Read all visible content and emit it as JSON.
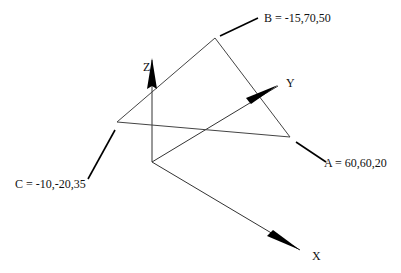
{
  "diagram": {
    "title": "",
    "axes": {
      "x": {
        "label": "X"
      },
      "y": {
        "label": "Y"
      },
      "z": {
        "label": "Z"
      }
    },
    "points": {
      "A": {
        "label": "A = 60,60,20",
        "coords": [
          60,
          60,
          20
        ]
      },
      "B": {
        "label": "B = -15,70,50",
        "coords": [
          -15,
          70,
          50
        ]
      },
      "C": {
        "label": "C = -10,-20,35",
        "coords": [
          -10,
          -20,
          35
        ]
      }
    },
    "shape": "triangle ABC in 3D coordinate system",
    "colors": {
      "line": "#333333",
      "arrow": "#000000",
      "background": "#ffffff"
    }
  }
}
